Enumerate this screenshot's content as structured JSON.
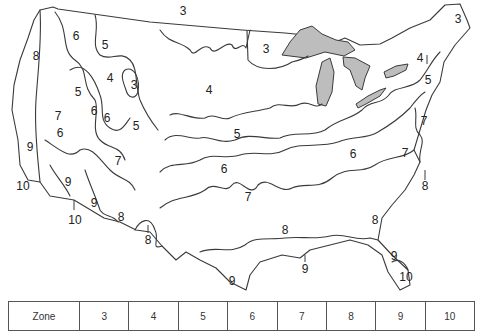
{
  "map": {
    "title": "USDA Plant Hardiness Zones (contiguous United States)",
    "lake_color": "#bdbdbd",
    "line_color": "#3a3a3a",
    "labels": [
      {
        "text": "3",
        "x": 183,
        "y": 11
      },
      {
        "text": "3",
        "x": 266,
        "y": 49
      },
      {
        "text": "3",
        "x": 458,
        "y": 19
      },
      {
        "text": "3",
        "x": 134,
        "y": 85
      },
      {
        "text": "4",
        "x": 209,
        "y": 90
      },
      {
        "text": "4",
        "x": 110,
        "y": 78
      },
      {
        "text": "4",
        "x": 420,
        "y": 58
      },
      {
        "text": "5",
        "x": 105,
        "y": 45
      },
      {
        "text": "5",
        "x": 237,
        "y": 134
      },
      {
        "text": "5",
        "x": 428,
        "y": 80
      },
      {
        "text": "5",
        "x": 136,
        "y": 126
      },
      {
        "text": "5",
        "x": 78,
        "y": 92
      },
      {
        "text": "6",
        "x": 76,
        "y": 36
      },
      {
        "text": "6",
        "x": 107,
        "y": 118
      },
      {
        "text": "6",
        "x": 60,
        "y": 133
      },
      {
        "text": "6",
        "x": 224,
        "y": 169
      },
      {
        "text": "6",
        "x": 353,
        "y": 154
      },
      {
        "text": "6",
        "x": 94,
        "y": 111
      },
      {
        "text": "7",
        "x": 118,
        "y": 161
      },
      {
        "text": "7",
        "x": 248,
        "y": 197
      },
      {
        "text": "7",
        "x": 405,
        "y": 153
      },
      {
        "text": "7",
        "x": 424,
        "y": 121
      },
      {
        "text": "7",
        "x": 58,
        "y": 116
      },
      {
        "text": "8",
        "x": 36,
        "y": 56
      },
      {
        "text": "8",
        "x": 121,
        "y": 217
      },
      {
        "text": "8",
        "x": 148,
        "y": 240
      },
      {
        "text": "8",
        "x": 285,
        "y": 230
      },
      {
        "text": "8",
        "x": 375,
        "y": 220
      },
      {
        "text": "8",
        "x": 425,
        "y": 186
      },
      {
        "text": "9",
        "x": 30,
        "y": 147
      },
      {
        "text": "9",
        "x": 68,
        "y": 182
      },
      {
        "text": "9",
        "x": 94,
        "y": 203
      },
      {
        "text": "9",
        "x": 232,
        "y": 281
      },
      {
        "text": "9",
        "x": 305,
        "y": 269
      },
      {
        "text": "9",
        "x": 394,
        "y": 256
      },
      {
        "text": "10",
        "x": 23,
        "y": 186
      },
      {
        "text": "10",
        "x": 75,
        "y": 220
      },
      {
        "text": "10",
        "x": 406,
        "y": 277
      }
    ]
  },
  "legend": {
    "header": "Zone",
    "zones": [
      "3",
      "4",
      "5",
      "6",
      "7",
      "8",
      "9",
      "10"
    ]
  }
}
